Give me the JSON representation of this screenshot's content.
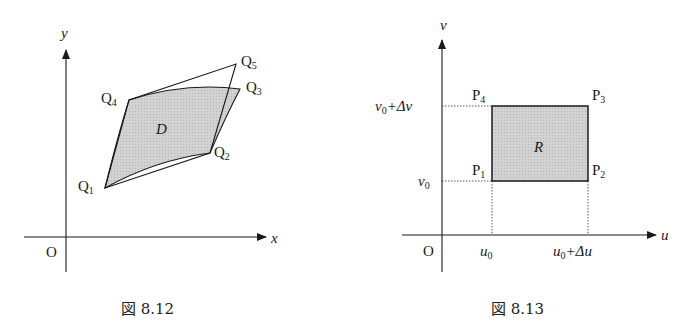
{
  "figures": [
    {
      "id": "fig-8-12",
      "caption": "図 8.12",
      "axes": {
        "x_label": "x",
        "y_label": "y",
        "origin_label": "O"
      },
      "region_label": "D",
      "points": [
        {
          "name": "Q",
          "sub": "1"
        },
        {
          "name": "Q",
          "sub": "2"
        },
        {
          "name": "Q",
          "sub": "3"
        },
        {
          "name": "Q",
          "sub": "4"
        },
        {
          "name": "Q",
          "sub": "5"
        }
      ]
    },
    {
      "id": "fig-8-13",
      "caption": "図 8.13",
      "axes": {
        "x_label": "u",
        "y_label": "v",
        "origin_label": "O"
      },
      "region_label": "R",
      "points": [
        {
          "name": "P",
          "sub": "1"
        },
        {
          "name": "P",
          "sub": "2"
        },
        {
          "name": "P",
          "sub": "3"
        },
        {
          "name": "P",
          "sub": "4"
        }
      ],
      "ticks": {
        "u0": {
          "base": "u",
          "sub": "0",
          "rest": ""
        },
        "u0du": {
          "base": "u",
          "sub": "0",
          "rest": "+Δu"
        },
        "v0": {
          "base": "v",
          "sub": "0",
          "rest": ""
        },
        "v0dv": {
          "base": "v",
          "sub": "0",
          "rest": "+Δv"
        }
      }
    }
  ],
  "colors": {
    "region_fill": "#c9c9c9",
    "line": "#1a1a1a"
  }
}
